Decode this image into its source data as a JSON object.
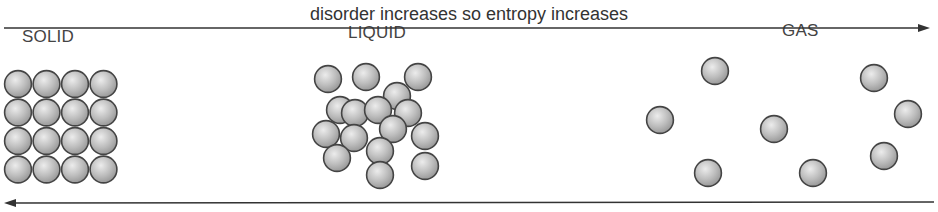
{
  "top_arrow": {
    "label": "disorder increases so entropy increases",
    "direction": "right",
    "y": 28,
    "x1": 4,
    "x2": 930
  },
  "bottom_arrow": {
    "direction": "left",
    "y": 203,
    "x1": 4,
    "x2": 934
  },
  "colors": {
    "particle_fill": "#b8b8b8",
    "particle_highlight": "#e6e6e6",
    "particle_stroke": "#444444",
    "line": "#333333",
    "text": "#444444"
  },
  "states": [
    {
      "name": "SOLID",
      "label_x": 22,
      "label_y": 44
    },
    {
      "name": "LIQUID",
      "label_x": 348,
      "label_y": 40
    },
    {
      "name": "GAS",
      "label_x": 782,
      "label_y": 38
    }
  ],
  "particle_radius": 14,
  "solid": {
    "grid_rows": 4,
    "grid_cols": 4,
    "origin_x": 18,
    "origin_y": 84,
    "spacing": 28.5
  },
  "liquid": [
    [
      328,
      79
    ],
    [
      366,
      77
    ],
    [
      418,
      77
    ],
    [
      397,
      96
    ],
    [
      340,
      110
    ],
    [
      355,
      113
    ],
    [
      378,
      110
    ],
    [
      408,
      113
    ],
    [
      326,
      134
    ],
    [
      354,
      138
    ],
    [
      393,
      129
    ],
    [
      425,
      136
    ],
    [
      380,
      151
    ],
    [
      337,
      158
    ],
    [
      380,
      175
    ],
    [
      425,
      166
    ]
  ],
  "gas": [
    [
      715,
      71
    ],
    [
      874,
      78
    ],
    [
      660,
      120
    ],
    [
      908,
      114
    ],
    [
      774,
      129
    ],
    [
      708,
      173
    ],
    [
      813,
      173
    ],
    [
      884,
      156
    ]
  ]
}
